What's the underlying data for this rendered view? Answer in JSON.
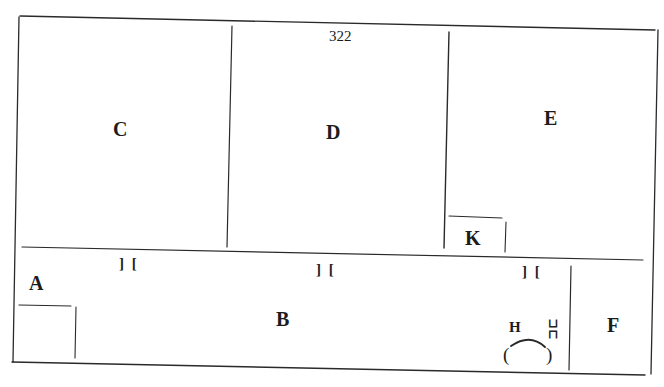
{
  "diagram": {
    "type": "floor-plan",
    "page_number": "322",
    "rooms": [
      {
        "id": "A",
        "label": "A"
      },
      {
        "id": "B",
        "label": "B"
      },
      {
        "id": "C",
        "label": "C"
      },
      {
        "id": "D",
        "label": "D"
      },
      {
        "id": "E",
        "label": "E"
      },
      {
        "id": "F",
        "label": "F"
      },
      {
        "id": "H",
        "label": "H"
      },
      {
        "id": "K",
        "label": "K"
      }
    ],
    "openings": [
      {
        "id": "door-1",
        "glyph": "] ["
      },
      {
        "id": "door-2",
        "glyph": "] ["
      },
      {
        "id": "door-3",
        "glyph": "] ["
      },
      {
        "id": "door-4",
        "glyph": "⊐⊏"
      }
    ],
    "hearth": {
      "left": "(",
      "right": ")"
    },
    "colors": {
      "line": "#2a2a2a",
      "text": "#1c1c1c",
      "background": "#ffffff"
    }
  }
}
